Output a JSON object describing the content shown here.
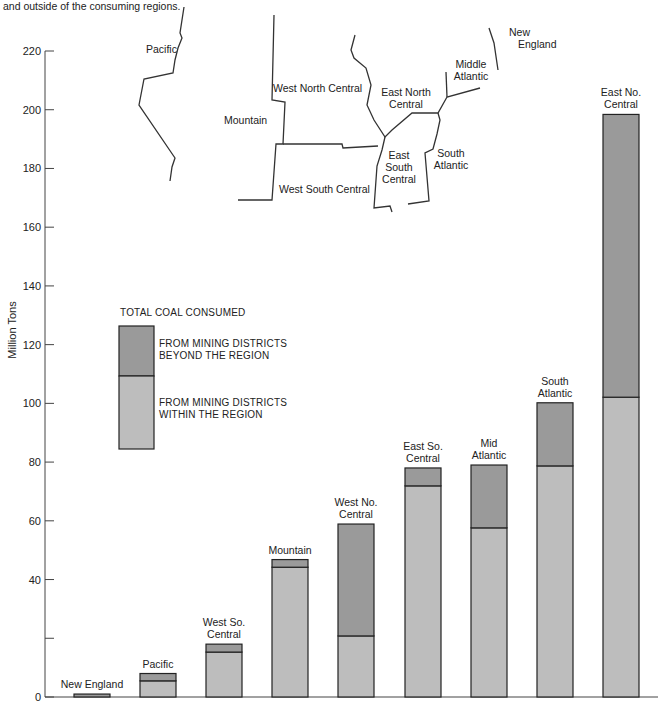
{
  "caption": "and outside of the consuming regions.",
  "colors": {
    "beyond": "#9a9a9a",
    "within": "#bdbdbd",
    "stroke": "#222222",
    "axis": "#444444"
  },
  "legend": {
    "title": "TOTAL COAL CONSUMED",
    "beyond_line1": "FROM MINING DISTRICTS",
    "beyond_line2": "BEYOND THE REGION",
    "within_line1": "FROM MINING DISTRICTS",
    "within_line2": "WITHIN THE REGION"
  },
  "map": {
    "labels": [
      "Pacific",
      "Mountain",
      "West North Central",
      "West South Central",
      "East North Central",
      "East South Central",
      "South Atlantic",
      "Middle Atlantic",
      "New England"
    ]
  },
  "chart_data": {
    "type": "bar",
    "stacked": true,
    "title": "",
    "xlabel": "",
    "ylabel": "Million Tons",
    "ylim": [
      0,
      220
    ],
    "yticks": [
      0,
      20,
      40,
      60,
      80,
      100,
      120,
      140,
      160,
      180,
      200,
      220
    ],
    "ytick_labels": [
      "0",
      "",
      "40",
      "60",
      "80",
      "100",
      "120",
      "140",
      "160",
      "180",
      "200",
      "220"
    ],
    "grid": false,
    "legend_placement": "left-middle",
    "categories": [
      [
        "New England"
      ],
      [
        "Pacific"
      ],
      [
        "West So.",
        "Central"
      ],
      [
        "Mountain"
      ],
      [
        "West No.",
        "Central"
      ],
      [
        "East So.",
        "Central"
      ],
      [
        "Mid",
        "Atlantic"
      ],
      [
        "South",
        "Atlantic"
      ],
      [
        "East No.",
        "Central"
      ]
    ],
    "series": [
      {
        "name": "From mining districts within the region",
        "values": [
          0,
          5.5,
          15.3,
          44.2,
          20.8,
          71.9,
          57.6,
          78.7,
          102.1
        ]
      },
      {
        "name": "From mining districts beyond the region",
        "values": [
          1,
          2.5,
          2.7,
          2.6,
          38.1,
          6.1,
          21.4,
          21.5,
          96.3
        ]
      }
    ],
    "totals": [
      1,
      8,
      18,
      46.8,
      58.9,
      78,
      79,
      100.2,
      198.4
    ]
  }
}
